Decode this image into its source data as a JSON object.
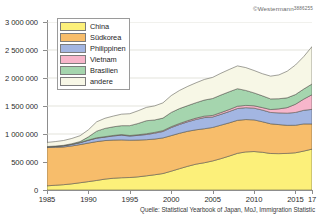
{
  "copyright": {
    "text": "©Westermann",
    "code": "3886255"
  },
  "source": {
    "text": "Quelle: Statistical Yearbook of Japan, MoJ, Immigration Statistic"
  },
  "legend": {
    "items": [
      {
        "label": "China",
        "color": "#fcf07a"
      },
      {
        "label": "Südkorea",
        "color": "#f7bd6b"
      },
      {
        "label": "Philippinen",
        "color": "#a3b6e2"
      },
      {
        "label": "Vietnam",
        "color": "#f7b6cb"
      },
      {
        "label": "Brasilien",
        "color": "#a5d5ae"
      },
      {
        "label": "andere",
        "color": "#f7f7e6"
      }
    ]
  },
  "axes": {
    "y": {
      "label": "",
      "ticks": [
        "0",
        "500 000",
        "1 000 000",
        "1 500 000",
        "2 000 000",
        "2 500 000",
        "3 000 000"
      ],
      "tick_values": [
        0,
        500000,
        1000000,
        1500000,
        2000000,
        2500000,
        3000000
      ],
      "min": 0,
      "max": 3000000
    },
    "x": {
      "label": "",
      "ticks": [
        "1985",
        "1990",
        "1995",
        "2000",
        "2005",
        "2010",
        "2015",
        "17"
      ],
      "tick_values": [
        1985,
        1990,
        1995,
        2000,
        2005,
        2010,
        2015,
        2017
      ],
      "min": 1985,
      "max": 2017
    }
  },
  "chart_data": {
    "type": "area",
    "stacked": true,
    "title": "",
    "subtitle": "",
    "xlabel": "",
    "ylabel": "",
    "xlim": [
      1985,
      2017
    ],
    "ylim": [
      0,
      3000000
    ],
    "grid": true,
    "legend_position": "top-left",
    "x": [
      1985,
      1986,
      1987,
      1988,
      1989,
      1990,
      1991,
      1992,
      1993,
      1994,
      1995,
      1996,
      1997,
      1998,
      1999,
      2000,
      2001,
      2002,
      2003,
      2004,
      2005,
      2006,
      2007,
      2008,
      2009,
      2010,
      2011,
      2012,
      2013,
      2014,
      2015,
      2016,
      2017
    ],
    "series": [
      {
        "name": "China",
        "color": "#fcf07a",
        "values": [
          75000,
          85000,
          95000,
          110000,
          130000,
          150000,
          171000,
          195000,
          210000,
          219000,
          223000,
          235000,
          253000,
          272000,
          294000,
          336000,
          381000,
          424000,
          462000,
          487000,
          519000,
          560000,
          606000,
          655000,
          680000,
          687000,
          674000,
          652000,
          649000,
          654000,
          665000,
          695000,
          730000
        ]
      },
      {
        "name": "Südkorea",
        "color": "#f7bd6b",
        "values": [
          683000,
          677000,
          673000,
          677000,
          681000,
          688000,
          693000,
          688000,
          682000,
          676000,
          666000,
          657000,
          645000,
          638000,
          636000,
          635000,
          632000,
          625000,
          613000,
          607000,
          598000,
          598000,
          593000,
          589000,
          578000,
          565000,
          545000,
          530000,
          519000,
          501000,
          491000,
          485000,
          450000
        ]
      },
      {
        "name": "Philippinen",
        "color": "#a3b6e2",
        "values": [
          12000,
          15000,
          20000,
          26000,
          33000,
          49000,
          61000,
          62000,
          73000,
          85000,
          74000,
          84000,
          93000,
          105000,
          115000,
          144000,
          157000,
          169000,
          185000,
          199000,
          187000,
          193000,
          202000,
          211000,
          212000,
          210000,
          209000,
          203000,
          209000,
          217000,
          229000,
          243000,
          260000
        ]
      },
      {
        "name": "Vietnam",
        "color": "#f7b6cb",
        "values": [
          4000,
          4500,
          5000,
          5500,
          6000,
          6200,
          7000,
          8000,
          9000,
          10000,
          10000,
          11000,
          13000,
          14000,
          15000,
          16000,
          18000,
          21000,
          24000,
          26000,
          28000,
          32000,
          36000,
          41000,
          41000,
          42000,
          44000,
          52000,
          72000,
          99000,
          146000,
          200000,
          262000
        ]
      },
      {
        "name": "Brasilien",
        "color": "#a5d5ae",
        "values": [
          2000,
          3000,
          5000,
          8000,
          15000,
          56000,
          119000,
          147000,
          154000,
          159000,
          176000,
          201000,
          233000,
          222000,
          224000,
          254000,
          266000,
          268000,
          275000,
          287000,
          302000,
          313000,
          317000,
          313000,
          267000,
          230000,
          210000,
          190000,
          181000,
          175000,
          173000,
          180000,
          191000
        ]
      },
      {
        "name": "andere",
        "color": "#f7f7e6",
        "values": [
          74000,
          80000,
          86000,
          94000,
          105000,
          126000,
          167000,
          181000,
          192000,
          205000,
          213000,
          227000,
          238000,
          251000,
          272000,
          301000,
          324000,
          344000,
          356000,
          368000,
          377000,
          389000,
          398000,
          407000,
          408000,
          400000,
          395000,
          406000,
          425000,
          475000,
          528000,
          579000,
          668000
        ]
      }
    ]
  }
}
